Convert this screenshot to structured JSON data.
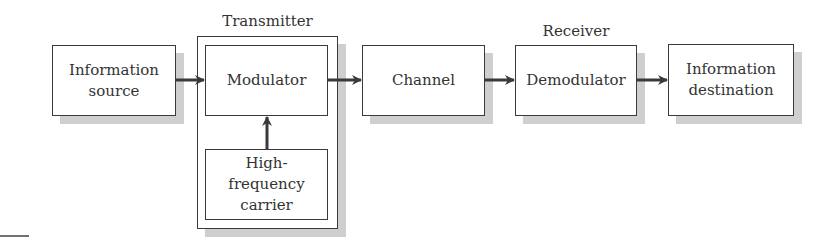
{
  "diagram": {
    "type": "block-diagram",
    "title": "",
    "groups": [
      {
        "id": "transmitter",
        "label": "Transmitter",
        "contains": [
          "modulator",
          "carrier"
        ]
      },
      {
        "id": "receiver",
        "label": "Receiver",
        "contains": [
          "demodulator"
        ]
      }
    ],
    "blocks": {
      "source": {
        "label": "Information source"
      },
      "modulator": {
        "label": "Modulator"
      },
      "carrier": {
        "label": "High-frequency carrier"
      },
      "channel": {
        "label": "Channel"
      },
      "demodulator": {
        "label": "Demodulator"
      },
      "destination": {
        "label": "Information destination"
      }
    },
    "edges": [
      {
        "from": "source",
        "to": "modulator"
      },
      {
        "from": "carrier",
        "to": "modulator"
      },
      {
        "from": "modulator",
        "to": "channel"
      },
      {
        "from": "channel",
        "to": "demodulator"
      },
      {
        "from": "demodulator",
        "to": "destination"
      }
    ],
    "colors": {
      "stroke": "#3a3a3a",
      "shadow": "#cfcfcf",
      "text": "#333333"
    }
  }
}
